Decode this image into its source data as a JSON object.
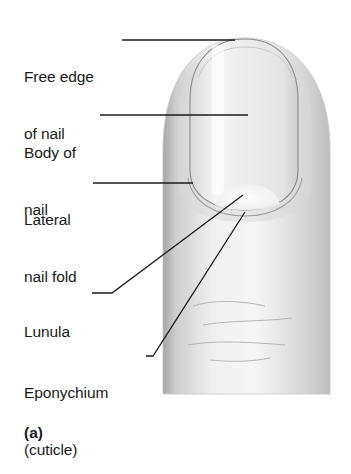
{
  "figure": {
    "panel_label": "(a)"
  },
  "labels": [
    {
      "id": "free-edge",
      "line1": "Free edge",
      "line2": "of nail"
    },
    {
      "id": "body-of-nail",
      "line1": "Body of",
      "line2": "nail"
    },
    {
      "id": "lateral-nail-fold",
      "line1": "Lateral",
      "line2": "nail fold"
    },
    {
      "id": "lunula",
      "line1": "Lunula",
      "line2": ""
    },
    {
      "id": "eponychium",
      "line1": "Eponychium",
      "line2": "(cuticle)"
    }
  ],
  "colors": {
    "background": "#ffffff",
    "skin_light": "#f2f2f2",
    "skin_shadow": "#b8b8b8",
    "nail_outline": "#8a8a8a",
    "leader_line": "#1a1a1a",
    "text": "#1a1a1a"
  }
}
